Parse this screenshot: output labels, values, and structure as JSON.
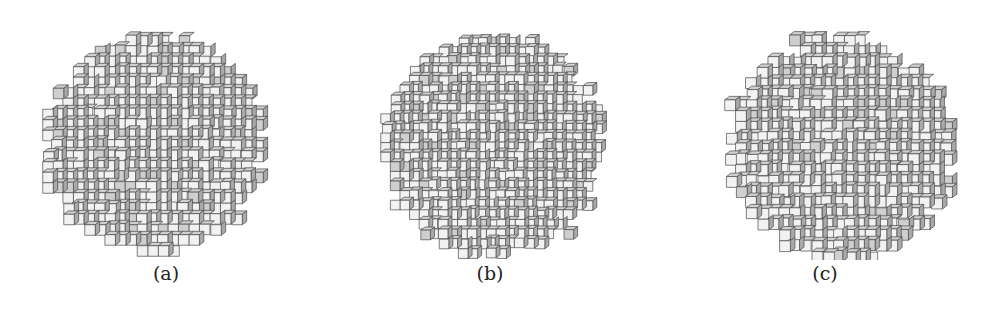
{
  "figure": {
    "panels": [
      {
        "id": "a",
        "caption": "(a)",
        "left": 16,
        "cx": 137,
        "cy": 146,
        "r": 108,
        "cell": 10.5,
        "noise": 0.1,
        "seed": 3
      },
      {
        "id": "b",
        "caption": "(b)",
        "left": 340,
        "cx": 152,
        "cy": 148,
        "r": 110,
        "cell": 9.6,
        "noise": 0.3,
        "seed": 11
      },
      {
        "id": "c",
        "caption": "(c)",
        "left": 675,
        "cx": 164,
        "cy": 149,
        "r": 112,
        "cell": 10.8,
        "noise": 0.45,
        "seed": 29
      }
    ],
    "colors": {
      "front_face": "#f2f2f2",
      "top_face": "#cfcfcf",
      "side_face": "#a9a9a9",
      "edge": "#4a4a4a",
      "caption_text": "#222222"
    }
  }
}
